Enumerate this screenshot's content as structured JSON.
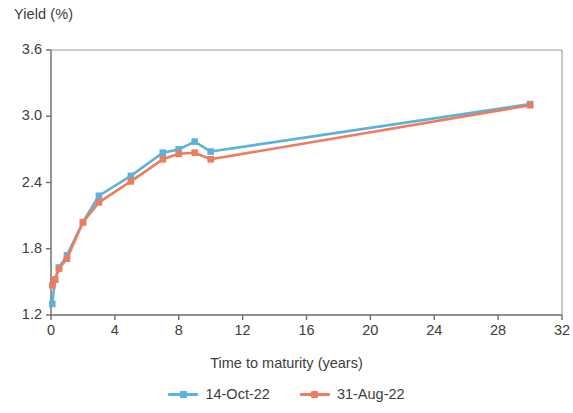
{
  "chart_data": {
    "type": "line",
    "title": "",
    "xlabel": "Time to maturity (years)",
    "ylabel": "Yield (%)",
    "xlim": [
      0,
      32
    ],
    "ylim": [
      1.2,
      3.6
    ],
    "xticks": [
      0,
      4,
      8,
      12,
      16,
      20,
      24,
      28,
      32
    ],
    "xtick_labels": [
      "0",
      "4",
      "8",
      "12",
      "16",
      "20",
      "24",
      "28",
      "32"
    ],
    "yticks": [
      1.2,
      1.8,
      2.4,
      3.0,
      3.6
    ],
    "ytick_labels": [
      "1.2",
      "1.8",
      "2.4",
      "3.0",
      "3.6"
    ],
    "grid": false,
    "legend_position": "bottom",
    "markers": "square",
    "series": [
      {
        "name": "14-Oct-22",
        "color": "#5BB3DC",
        "x": [
          0.08,
          0.25,
          0.5,
          1,
          2,
          3,
          5,
          7,
          8,
          9,
          10,
          30
        ],
        "values": [
          1.3,
          1.52,
          1.63,
          1.74,
          2.04,
          2.28,
          2.46,
          2.67,
          2.7,
          2.77,
          2.68,
          3.11
        ]
      },
      {
        "name": "31-Aug-22",
        "color": "#ED7D5E",
        "x": [
          0.08,
          0.25,
          0.5,
          1,
          2,
          3,
          5,
          7,
          8,
          9,
          10,
          30
        ],
        "values": [
          1.47,
          1.52,
          1.62,
          1.71,
          2.04,
          2.22,
          2.41,
          2.61,
          2.66,
          2.67,
          2.61,
          3.1
        ]
      }
    ]
  },
  "legend": {
    "items": [
      {
        "label": "14-Oct-22",
        "color": "#5BB3DC"
      },
      {
        "label": "31-Aug-22",
        "color": "#ED7D5E"
      }
    ]
  },
  "axes": {
    "frame_color": "#6b6b6b"
  }
}
